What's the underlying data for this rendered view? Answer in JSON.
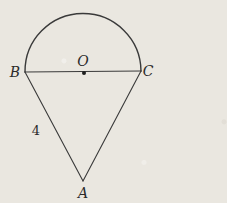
{
  "diagram": {
    "labels": {
      "vertex_a": "A",
      "vertex_b": "B",
      "vertex_c": "C",
      "center": "O",
      "side_ab_length": "4"
    },
    "colors": {
      "background": "#eae7e0",
      "stroke": "#3a3a3a",
      "text": "#2b2b2b"
    }
  }
}
